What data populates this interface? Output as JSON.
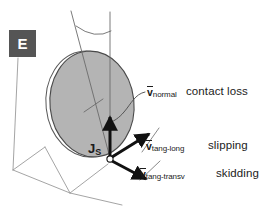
{
  "figure": {
    "background_color": "#ffffff",
    "width": 267,
    "height": 220
  },
  "panel_marker": {
    "label": "E",
    "box_color": "#555555",
    "text_color": "#ffffff"
  },
  "contact_point": {
    "label_base": "J",
    "label_sub": "S"
  },
  "disc": {
    "fill_color": "#b4b4b4",
    "outline_color": "#4a4a4a"
  },
  "vectors": [
    {
      "symbol": "v",
      "subscript": "normal",
      "phrase": "contact loss",
      "direction": "up",
      "color": "#111111"
    },
    {
      "symbol": "v",
      "subscript": "tang-long",
      "phrase": "slipping",
      "direction": "upper-right",
      "color": "#111111"
    },
    {
      "symbol": "v",
      "subscript": "tang-transv",
      "phrase": "skidding",
      "direction": "lower-right",
      "color": "#111111"
    }
  ],
  "ground_plane": {
    "line_color": "#9a9a9a"
  },
  "axes": {
    "line_color": "#6b6b6b",
    "arc_color": "#6b6b6b"
  }
}
